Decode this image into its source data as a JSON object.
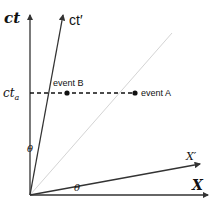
{
  "diagram": {
    "labels": {
      "ct_axis": "ct",
      "ct_prime_axis": "ct′",
      "x_axis": "X",
      "x_prime_axis": "X′",
      "ct_a": "ct",
      "ct_a_sub": "a",
      "theta_time": "θ",
      "theta_space": "θ",
      "event_a": "event A",
      "event_b": "event B"
    },
    "colors": {
      "axis": "#333333",
      "light_cone": "#d4d4d4",
      "dashed_line": "#111111",
      "event_dot": "#111111"
    },
    "geometry": {
      "origin": [
        30,
        195
      ],
      "ct_axis_end": [
        30,
        14
      ],
      "ct_prime_axis_end": [
        63,
        14
      ],
      "x_axis_end": [
        208,
        195
      ],
      "x_prime_axis_end": [
        200,
        164
      ],
      "light_line_end": [
        172,
        33
      ],
      "simultaneity_y": 93,
      "event_b_x": 67,
      "event_a_x": 135
    }
  }
}
